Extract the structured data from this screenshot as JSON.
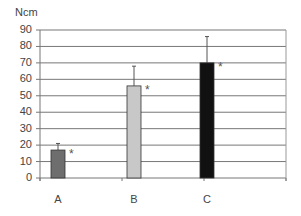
{
  "chart_data": {
    "type": "bar",
    "title": "",
    "xlabel": "",
    "ylabel": "Ncm",
    "categories": [
      "A",
      "B",
      "C"
    ],
    "values": [
      17,
      56,
      70
    ],
    "error_upper": [
      21,
      68,
      86
    ],
    "significance_markers": [
      "*",
      "*",
      "*"
    ],
    "bar_colors": [
      "#6e6e6e",
      "#c8c8c8",
      "#111111"
    ],
    "ylim": [
      0,
      90
    ],
    "yticks": [
      0,
      10,
      20,
      30,
      40,
      50,
      60,
      70,
      80,
      90
    ],
    "grid": true,
    "legend": null
  }
}
